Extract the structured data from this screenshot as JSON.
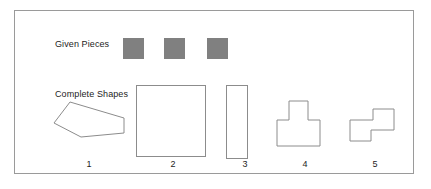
{
  "diagram": {
    "given_pieces_label": "Given Pieces",
    "complete_shapes_label": "Complete Shapes",
    "piece_color": "#808080",
    "outline_color": "#8c8c8c",
    "frame_color": "#9a9a9a",
    "background": "#ffffff",
    "given_pieces": [
      {
        "name": "square-piece-1",
        "shape": "square",
        "size": 21
      },
      {
        "name": "square-piece-2",
        "shape": "square",
        "size": 21
      },
      {
        "name": "square-piece-3",
        "shape": "square",
        "size": 21
      }
    ],
    "complete_shapes": [
      {
        "number": "1",
        "name": "arrow-wedge-shape",
        "shape": "irregular-polygon"
      },
      {
        "number": "2",
        "name": "large-square-shape",
        "shape": "square"
      },
      {
        "number": "3",
        "name": "tall-rectangle-shape",
        "shape": "rectangle"
      },
      {
        "number": "4",
        "name": "t-shape",
        "shape": "tee-polyomino"
      },
      {
        "number": "5",
        "name": "s-shape",
        "shape": "s-polyomino"
      }
    ],
    "numbers": [
      "1",
      "2",
      "3",
      "4",
      "5"
    ]
  }
}
